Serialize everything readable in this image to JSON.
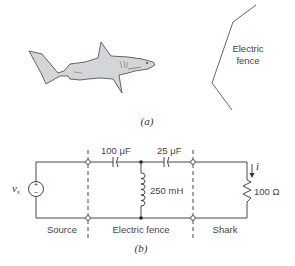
{
  "figure_a": {
    "caption": "(a)",
    "fence_label_line1": "Electric",
    "fence_label_line2": "fence",
    "shark_body_color": "#d3d6d8",
    "shark_outline_color": "#555555"
  },
  "figure_b": {
    "caption": "(b)",
    "source_label": "vs",
    "source_symbol_plus": "+",
    "source_symbol_minus": "−",
    "capacitor1_label": "100 μF",
    "capacitor2_label": "25 μF",
    "inductor_label": "250 mH",
    "resistor_label": "100 Ω",
    "current_label": "i",
    "section_labels": {
      "source": "Source",
      "fence": "Electric fence",
      "shark": "Shark"
    },
    "wire_color": "#333333"
  }
}
